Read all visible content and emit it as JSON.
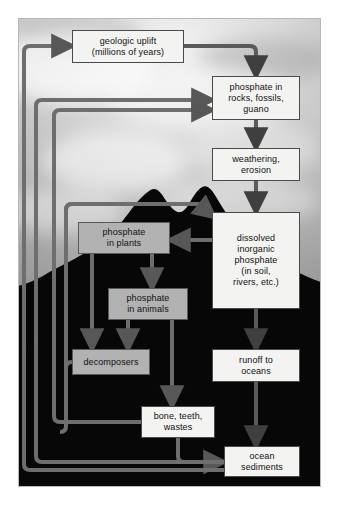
{
  "figure": {
    "kind": "phosphorus-cycle-flowchart",
    "background_image": "mountain silhouette against cloudy sky",
    "caption": ""
  },
  "colors": {
    "box_white_fill": "#f3f3f1",
    "box_gray_fill": "#b2b2b2",
    "box_border": "#4a4a4a",
    "connector": "#6e6e6e",
    "arrow_dark": "#4f4f4f",
    "photo_sky": "#c9c9c9",
    "photo_mountain": "#070707"
  },
  "nodes": [
    {
      "id": "uplift",
      "label": "geologic uplift\n(millions of years)",
      "style": "white"
    },
    {
      "id": "rocks",
      "label": "phosphate in\nrocks, fossils,\nguano",
      "style": "white"
    },
    {
      "id": "weather",
      "label": "weathering,\nerosion",
      "style": "white"
    },
    {
      "id": "dissolved",
      "label": "dissolved\ninorganic\nphosphate\n(in soil,\nrivers, etc.)",
      "style": "white"
    },
    {
      "id": "plants",
      "label": "phosphate\nin plants",
      "style": "gray"
    },
    {
      "id": "animals",
      "label": "phosphate\nin animals",
      "style": "gray"
    },
    {
      "id": "decomp",
      "label": "decomposers",
      "style": "gray"
    },
    {
      "id": "runoff",
      "label": "runoff to\noceans",
      "style": "white"
    },
    {
      "id": "bone",
      "label": "bone, teeth,\nwastes",
      "style": "white"
    },
    {
      "id": "ocean",
      "label": "ocean\nsediments",
      "style": "white"
    }
  ],
  "edges": [
    {
      "from": "uplift",
      "to": "rocks",
      "route": "right-down"
    },
    {
      "from": "rocks",
      "to": "weather",
      "route": "down"
    },
    {
      "from": "weather",
      "to": "dissolved",
      "route": "down"
    },
    {
      "from": "dissolved",
      "to": "plants",
      "route": "left"
    },
    {
      "from": "dissolved",
      "to": "runoff",
      "route": "down"
    },
    {
      "from": "plants",
      "to": "animals",
      "route": "down-right"
    },
    {
      "from": "plants",
      "to": "decomp",
      "route": "down"
    },
    {
      "from": "animals",
      "to": "decomp",
      "route": "down-left"
    },
    {
      "from": "animals",
      "to": "bone",
      "route": "down"
    },
    {
      "from": "runoff",
      "to": "ocean",
      "route": "down"
    },
    {
      "from": "bone",
      "to": "ocean",
      "route": "down-right"
    },
    {
      "from": "decomp",
      "to": "dissolved",
      "route": "left-up-around"
    },
    {
      "from": "bone",
      "to": "dissolved",
      "route": "left-up-around"
    },
    {
      "from": "ocean",
      "to": "uplift",
      "route": "left-up-around"
    },
    {
      "from": "ocean",
      "to": "rocks",
      "route": "left-up-around"
    }
  ]
}
